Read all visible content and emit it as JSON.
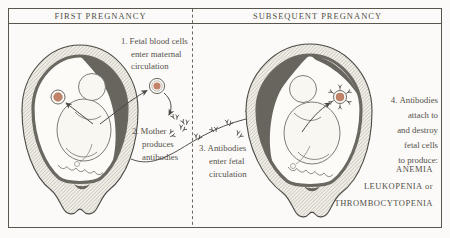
{
  "figure": {
    "colors": {
      "ink": "#4c4a44",
      "text": "#55524b",
      "cell_fill": "#c28368",
      "shading": "#67655d",
      "background": "#fbfaf8"
    }
  },
  "panels": {
    "first": {
      "header": "FIRST PREGNANCY"
    },
    "subsequent": {
      "header": "SUBSEQUENT PREGNANCY"
    }
  },
  "steps": [
    {
      "num": "1.",
      "lines": [
        "Fetal blood cells",
        "enter maternal",
        "circulation"
      ]
    },
    {
      "num": "2.",
      "lines": [
        "Mother",
        "produces",
        "antibodies"
      ]
    },
    {
      "num": "3.",
      "lines": [
        "Antibodies",
        "enter fetal",
        "circulation"
      ]
    },
    {
      "num": "4.",
      "lines": [
        "Antibodies",
        "attach to",
        "and destroy",
        "fetal cells",
        "to produce:"
      ]
    }
  ],
  "outcomes": [
    "ANEMIA",
    "LEUKOPENIA or",
    "THROMBOCYTOPENIA"
  ]
}
